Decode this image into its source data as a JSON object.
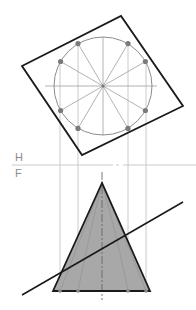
{
  "diagram": {
    "type": "orthographic projection of a cone cut by an inclined plane",
    "view_labels": {
      "top_view": "H",
      "front_view": "F"
    },
    "colors": {
      "outline": "#1a1a1a",
      "construction": "#b5b5b5",
      "circle": "#8c8c8c",
      "points": "#7a7a7a",
      "cone_fill": "#a8a8a8",
      "fold_line": "#c4c4c4"
    },
    "top_view": {
      "square": [
        [
          22,
          66
        ],
        [
          121,
          16
        ],
        [
          183,
          106
        ],
        [
          82,
          155
        ]
      ],
      "circle": {
        "cx": 103,
        "cy": 86,
        "r": 49
      },
      "division_points": 12
    },
    "fold_line_y": 165,
    "front_view": {
      "apex": [
        102,
        183
      ],
      "base_left": [
        53,
        291
      ],
      "base_right": [
        150,
        291
      ],
      "cutting_plane": [
        [
          22,
          295
        ],
        [
          183,
          202
        ]
      ]
    },
    "projector_x": [
      60,
      78,
      128,
      146
    ]
  }
}
